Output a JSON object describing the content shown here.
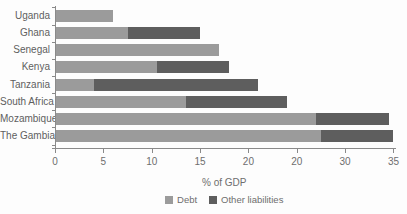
{
  "chart_data": {
    "type": "bar",
    "orientation": "horizontal",
    "stacked": true,
    "title": "",
    "xlabel": "% of GDP",
    "ylabel": "",
    "categories": [
      "Uganda",
      "Ghana",
      "Senegal",
      "Kenya",
      "Tanzania",
      "South Africa",
      "Mozambique",
      "The Gambia"
    ],
    "series": [
      {
        "name": "Debt",
        "color": "#9b9b9b",
        "values": [
          6,
          7.5,
          17,
          10.5,
          4,
          13.5,
          27,
          27.5
        ]
      },
      {
        "name": "Other liabilities",
        "color": "#5e5e5e",
        "values": [
          0,
          7.5,
          0,
          7.5,
          17,
          10.5,
          7.5,
          7.5
        ]
      }
    ],
    "totals": [
      6,
      15,
      17,
      18,
      21,
      24,
      34.5,
      35
    ],
    "xlim": [
      0,
      35
    ],
    "x_tick_values": [
      0,
      5,
      10,
      15,
      20,
      25,
      30,
      35
    ],
    "x_tick_labels": [
      "0",
      "5",
      "10",
      "15",
      "20",
      "20",
      "30",
      "35"
    ],
    "grid": false,
    "legend_position": "bottom"
  }
}
